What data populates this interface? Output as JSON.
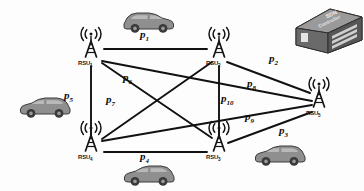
{
  "diagram": {
    "background": "#fdfdfd",
    "link_color": "#111111",
    "node_color": "#1a1a1a",
    "car_body_color": "#8c8c8c",
    "car_dark_color": "#4a4a4a",
    "controller_color": "#6e6e6e"
  },
  "controller": {
    "name": "sdn-controller",
    "label_line1": "SDN",
    "label_line2": "Controller"
  },
  "nodes": [
    {
      "id": "rsu1",
      "label": "RSU",
      "sub": "1",
      "x": 91,
      "y": 64
    },
    {
      "id": "rsu2",
      "label": "RSU",
      "sub": "2",
      "x": 219,
      "y": 64
    },
    {
      "id": "rsu3",
      "label": "RSU",
      "sub": "3",
      "x": 219,
      "y": 146
    },
    {
      "id": "rsu4",
      "label": "RSU",
      "sub": "4",
      "x": 91,
      "y": 146
    },
    {
      "id": "rsu5",
      "label": "RSU",
      "sub": "5",
      "x": 319,
      "y": 103
    }
  ],
  "links": [
    {
      "id": "p1",
      "label": "p",
      "sub": "1",
      "from": "rsu1",
      "to": "rsu2",
      "label_x": 148,
      "label_y": 38
    },
    {
      "id": "p2",
      "label": "p",
      "sub": "2",
      "from": "rsu2",
      "to": "rsu5",
      "label_x": 277,
      "label_y": 56
    },
    {
      "id": "p3",
      "label": "p",
      "sub": "3",
      "from": "rsu3",
      "to": "rsu5",
      "label_x": 285,
      "label_y": 128
    },
    {
      "id": "p4",
      "label": "p",
      "sub": "4",
      "from": "rsu4",
      "to": "rsu3",
      "label_x": 148,
      "label_y": 152
    },
    {
      "id": "p5",
      "label": "p",
      "sub": "5",
      "from": "rsu1",
      "to": "rsu4",
      "label_x": 71,
      "label_y": 96
    },
    {
      "id": "p6",
      "label": "p",
      "sub": "6",
      "from": "rsu1",
      "to": "rsu3",
      "label_x": 130,
      "label_y": 78
    },
    {
      "id": "p7",
      "label": "p",
      "sub": "7",
      "from": "rsu4",
      "to": "rsu2",
      "label_x": 113,
      "label_y": 100
    },
    {
      "id": "p8",
      "label": "p",
      "sub": "8",
      "from": "rsu1",
      "to": "rsu5",
      "label_x": 255,
      "label_y": 82
    },
    {
      "id": "p9",
      "label": "p",
      "sub": "9",
      "from": "rsu4",
      "to": "rsu5",
      "label_x": 253,
      "label_y": 114
    },
    {
      "id": "p10",
      "label": "p",
      "sub": "10",
      "from": "rsu2",
      "to": "rsu3",
      "label_x": 223,
      "label_y": 98
    }
  ],
  "vehicles": [
    {
      "id": "car-top",
      "x": 122,
      "y": 10,
      "facing": "right"
    },
    {
      "id": "car-left",
      "x": 18,
      "y": 95,
      "facing": "left"
    },
    {
      "id": "car-bottom",
      "x": 122,
      "y": 163,
      "facing": "left"
    },
    {
      "id": "car-bottom-right",
      "x": 253,
      "y": 143,
      "facing": "left"
    }
  ]
}
